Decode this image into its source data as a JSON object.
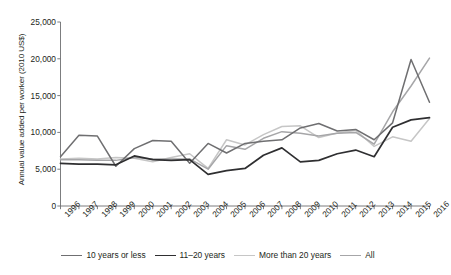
{
  "chart_data": {
    "type": "line",
    "title": "",
    "xlabel": "",
    "ylabel": "Annual value added per worker (2010 US$)",
    "x": [
      1996,
      1997,
      1998,
      1999,
      2000,
      2001,
      2002,
      2003,
      2004,
      2005,
      2006,
      2007,
      2008,
      2009,
      2010,
      2011,
      2012,
      2013,
      2014,
      2015,
      2016
    ],
    "xtick_labels": [
      "1996",
      "1997",
      "1998",
      "1999",
      "2000",
      "2001",
      "2002",
      "2003",
      "2004",
      "2005",
      "2006",
      "2007",
      "2008",
      "2009",
      "2010",
      "2011",
      "2012",
      "2013",
      "2014",
      "2015",
      "2016"
    ],
    "ytick_labels": [
      "0",
      "5,000",
      "10,000",
      "15,000",
      "20,000",
      "25,000"
    ],
    "ytick_values": [
      0,
      5000,
      10000,
      15000,
      20000,
      25000
    ],
    "ylim": [
      0,
      25000
    ],
    "grid": false,
    "legend_position": "bottom",
    "series": [
      {
        "name": "10 years or less",
        "color": "#6f6f71",
        "width": 1.5,
        "values": [
          6700,
          9600,
          9500,
          5400,
          7800,
          8900,
          8800,
          5800,
          8500,
          7200,
          8500,
          8800,
          9000,
          10600,
          11200,
          10200,
          10400,
          9000,
          11300,
          19900,
          14100
        ]
      },
      {
        "name": "11–20 years",
        "color": "#2f2f31",
        "width": 1.7,
        "values": [
          5800,
          5700,
          5700,
          5600,
          6800,
          6300,
          6200,
          6300,
          4300,
          4800,
          5100,
          6900,
          7900,
          6000,
          6200,
          7100,
          7600,
          6700,
          10700,
          11700,
          12000
        ]
      },
      {
        "name": "More than 20 years",
        "color": "#c6c6c6",
        "width": 1.5,
        "values": [
          6400,
          6500,
          6400,
          6600,
          6500,
          6000,
          6600,
          7100,
          5100,
          9000,
          8300,
          9700,
          10800,
          10900,
          9300,
          9900,
          10300,
          8100,
          9400,
          8800,
          11900
        ]
      },
      {
        "name": "All",
        "color": "#a6a6a8",
        "width": 1.5,
        "values": [
          6300,
          6300,
          6200,
          6200,
          6600,
          6400,
          6400,
          6400,
          5000,
          8200,
          7700,
          9200,
          10100,
          9900,
          9500,
          9900,
          10000,
          8400,
          12800,
          16300,
          20100
        ]
      }
    ]
  },
  "legend": {
    "items": [
      {
        "label": "10 years or less"
      },
      {
        "label": "11–20 years"
      },
      {
        "label": "More than 20 years"
      },
      {
        "label": "All"
      }
    ]
  }
}
